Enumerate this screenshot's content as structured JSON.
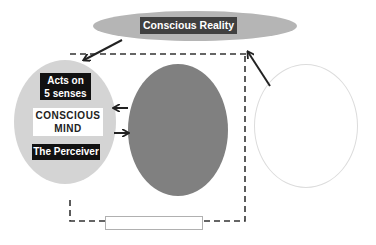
{
  "diagram": {
    "top_node": {
      "label": "Conscious Reality",
      "fill": "#b5b5b5",
      "label_bg": "#404040"
    },
    "left_node": {
      "fill": "#d4d4d4",
      "labels": {
        "senses": {
          "line1": "Acts on",
          "line2": "5 senses"
        },
        "mind": {
          "line1": "CONSCIOUS",
          "line2": "MIND"
        },
        "role": "The Perceiver"
      }
    },
    "middle_node": {
      "fill": "#808080",
      "label": ""
    },
    "right_node": {
      "fill": "#ffffff",
      "stroke": "#dcdcdc",
      "label": ""
    },
    "bottom_box": {
      "label": ""
    },
    "connectors": [
      {
        "from": "top_node",
        "to": "left_node",
        "style": "solid-arrow"
      },
      {
        "from": "right_node",
        "to": "top_node",
        "style": "solid-arrow"
      },
      {
        "from": "middle_node",
        "to": "left_node",
        "style": "solid-arrow"
      },
      {
        "from": "left_node",
        "to": "middle_node",
        "style": "solid-arrow"
      },
      {
        "from": "left_node",
        "to": "top_node",
        "style": "dashed-loop",
        "via": "bottom_box"
      }
    ]
  }
}
